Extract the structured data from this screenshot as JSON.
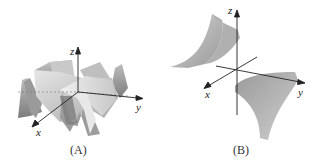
{
  "figures": [
    {
      "id": "A",
      "caption": "(A)",
      "axes": {
        "x": "x",
        "y": "y",
        "z": "z"
      },
      "description": "Oscillating wavy surface with radial ridges"
    },
    {
      "id": "B",
      "caption": "(B)",
      "axes": {
        "x": "x",
        "y": "y",
        "z": "z"
      },
      "description": "Two curved surface sheets in opposite quadrants"
    }
  ],
  "colors": {
    "surface_light": "#d8d8d8",
    "surface_mid": "#b4b4b4",
    "surface_dark": "#8a8a8a",
    "axis": "#222222",
    "background": "#ffffff"
  }
}
